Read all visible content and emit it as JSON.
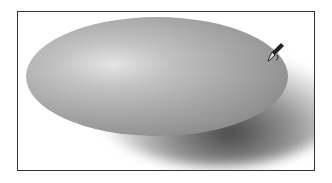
{
  "canvas": {
    "shape": "ellipse",
    "fill": "radial-gradient gray",
    "shadow": "drop-shadow lower-right",
    "colors": {
      "frame_border": "#333333",
      "highlight": "#e4e4e4",
      "body": "#a6a6a6",
      "edge": "#868686",
      "shadow": "#282828"
    }
  },
  "cursor": {
    "icon": "eyedropper-icon"
  }
}
